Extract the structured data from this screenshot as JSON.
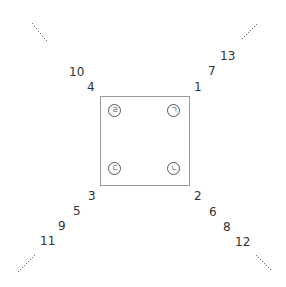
{
  "diagram": {
    "square": {
      "label": "center-square"
    },
    "corners": [
      {
        "pos": "top-left",
        "jamo": "ㄹ"
      },
      {
        "pos": "top-right",
        "jamo": "ㄱ"
      },
      {
        "pos": "bottom-left",
        "jamo": "ㄷ"
      },
      {
        "pos": "bottom-right",
        "jamo": "ㄴ"
      }
    ],
    "arms": {
      "top_right": [
        "1",
        "7",
        "13"
      ],
      "bottom_right": [
        "2",
        "6",
        "8",
        "12"
      ],
      "bottom_left": [
        "3",
        "5",
        "9",
        "11"
      ],
      "top_left": [
        "4",
        "10"
      ]
    },
    "continuation": "·····"
  }
}
